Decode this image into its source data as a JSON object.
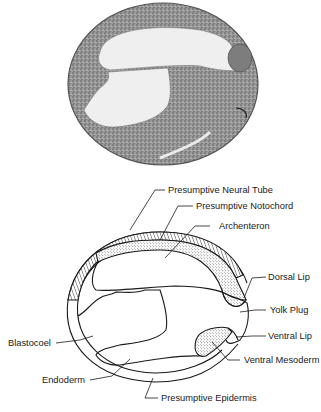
{
  "figure": {
    "photo": {
      "description": "Micrograph section of a gastrula embryo",
      "background": "#ffffff",
      "tissue_color": "#8a8a8a",
      "cavity_color": "#efefef"
    },
    "diagram": {
      "line_color": "#1a1a1a",
      "labels": [
        {
          "id": "neural-tube",
          "text": "Presumptive Neural Tube"
        },
        {
          "id": "notochord",
          "text": "Presumptive Notochord"
        },
        {
          "id": "archenteron",
          "text": "Archenteron"
        },
        {
          "id": "dorsal-lip",
          "text": "Dorsal Lip"
        },
        {
          "id": "yolk-plug",
          "text": "Yolk Plug"
        },
        {
          "id": "ventral-lip",
          "text": "Ventral Lip"
        },
        {
          "id": "ventral-mesoderm",
          "text": "Ventral Mesoderm"
        },
        {
          "id": "blastocoel",
          "text": "Blastocoel"
        },
        {
          "id": "endoderm",
          "text": "Endoderm"
        },
        {
          "id": "epidermis",
          "text": "Presumptive Epidermis"
        }
      ]
    }
  }
}
